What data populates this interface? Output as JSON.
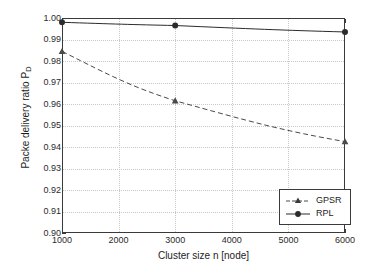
{
  "chart_data": {
    "type": "line",
    "title": "",
    "xlabel": "Cluster size n [node]",
    "ylabel": "Packe delivery ratio P",
    "ylabel_sub": "D",
    "x": [
      1000,
      3000,
      6000
    ],
    "xlim": [
      1000,
      6000
    ],
    "ylim": [
      0.9,
      1.0
    ],
    "xticks": [
      1000,
      2000,
      3000,
      4000,
      5000,
      6000
    ],
    "xtick_labels": [
      "1000",
      "2000",
      "3000",
      "4000",
      "5000",
      "6000"
    ],
    "yticks": [
      0.9,
      0.91,
      0.92,
      0.93,
      0.94,
      0.95,
      0.96,
      0.97,
      0.98,
      0.99,
      1.0
    ],
    "ytick_labels": [
      "0.90",
      "0.91",
      "0.92",
      "0.93",
      "0.94",
      "0.95",
      "0.96",
      "0.97",
      "0.98",
      "0.99",
      "1.00"
    ],
    "grid": true,
    "legend_position": "lower right",
    "series": [
      {
        "name": "GPSR",
        "values": [
          0.9845,
          0.9615,
          0.9425
        ],
        "marker": "triangle",
        "linestyle": "dashed",
        "color": "#4a4a4a"
      },
      {
        "name": "RPL",
        "values": [
          0.998,
          0.9965,
          0.9935
        ],
        "marker": "circle",
        "linestyle": "solid",
        "color": "#2b2b2b"
      }
    ]
  },
  "legend": {
    "items": [
      {
        "label": "GPSR"
      },
      {
        "label": "RPL"
      }
    ]
  },
  "colors": {
    "axis": "#3a3a3a",
    "grid": "#c8c8c8",
    "background": "#ffffff",
    "gpsr": "#4a4a4a",
    "rpl": "#2b2b2b"
  }
}
